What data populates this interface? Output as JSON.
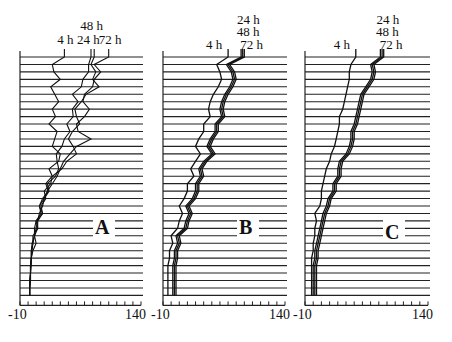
{
  "chart_data": {
    "type": "line",
    "title": "",
    "xlabel": "",
    "ylabel": "",
    "xlim": [
      -10,
      140
    ],
    "x_tick_labels": [
      "-10",
      "140"
    ],
    "x_tick_step": 10,
    "rows": 33,
    "grid": false,
    "panels": [
      {
        "label": "A",
        "series_labels": [
          "4 h",
          "24 h",
          "48 h",
          "72 h"
        ],
        "header_labels": [
          {
            "text": "48 h",
            "row": 0
          },
          {
            "text": "4 h",
            "row": 1
          },
          {
            "text": "24 h",
            "row": 1
          },
          {
            "text": "72 h",
            "row": 1
          }
        ],
        "series": [
          {
            "name": "4 h",
            "values": [
              45,
              30,
              32,
              40,
              28,
              33,
              38,
              30,
              34,
              26,
              36,
              33,
              30,
              40,
              38,
              26,
              30,
              22,
              25,
              18,
              14,
              18,
              12,
              12,
              8,
              10,
              6,
              4,
              4,
              3,
              3,
              2,
              2
            ]
          },
          {
            "name": "24 h",
            "values": [
              78,
              75,
              75,
              68,
              66,
              55,
              62,
              55,
              56,
              48,
              52,
              45,
              42,
              35,
              36,
              38,
              34,
              24,
              26,
              20,
              14,
              16,
              10,
              12,
              6,
              6,
              4,
              4,
              3,
              3,
              3,
              2,
              2
            ]
          },
          {
            "name": "48 h",
            "values": [
              82,
              78,
              84,
              80,
              88,
              72,
              66,
              58,
              60,
              64,
              55,
              50,
              56,
              60,
              48,
              42,
              30,
              28,
              20,
              22,
              16,
              18,
              10,
              8,
              8,
              5,
              4,
              4,
              3,
              3,
              2,
              2,
              2
            ]
          },
          {
            "name": "72 h",
            "values": [
              100,
              82,
              90,
              82,
              80,
              70,
              68,
              76,
              70,
              60,
              62,
              78,
              60,
              52,
              44,
              40,
              36,
              30,
              24,
              20,
              18,
              14,
              12,
              10,
              8,
              6,
              5,
              4,
              3,
              3,
              2,
              2,
              2
            ]
          }
        ]
      },
      {
        "label": "B",
        "series_labels": [
          "4 h",
          "24 h",
          "48 h",
          "72 h"
        ],
        "header_labels": [
          {
            "text": "24 h",
            "row": -2
          },
          {
            "text": "48 h",
            "row": -1
          },
          {
            "text": "4 h",
            "row": 0
          },
          {
            "text": "72 h",
            "row": 0
          }
        ],
        "series": [
          {
            "name": "4 h",
            "values": [
              70,
              56,
              60,
              62,
              58,
              52,
              48,
              46,
              48,
              40,
              40,
              34,
              30,
              36,
              30,
              24,
              28,
              20,
              20,
              16,
              10,
              14,
              10,
              8,
              0,
              2,
              -2,
              -2,
              -4,
              -4,
              -4,
              -4,
              -4
            ]
          },
          {
            "name": "24 h",
            "values": [
              86,
              68,
              74,
              76,
              72,
              66,
              62,
              60,
              62,
              54,
              54,
              48,
              44,
              50,
              40,
              34,
              36,
              30,
              30,
              26,
              18,
              22,
              18,
              16,
              6,
              8,
              4,
              4,
              2,
              2,
              2,
              2,
              2
            ]
          },
          {
            "name": "48 h",
            "values": [
              88,
              70,
              76,
              78,
              74,
              68,
              64,
              62,
              64,
              56,
              56,
              50,
              46,
              52,
              42,
              36,
              38,
              32,
              32,
              28,
              20,
              24,
              20,
              18,
              8,
              10,
              6,
              6,
              4,
              4,
              4,
              4,
              4
            ]
          },
          {
            "name": "72 h",
            "values": [
              90,
              72,
              78,
              80,
              76,
              70,
              66,
              64,
              66,
              58,
              58,
              52,
              48,
              54,
              44,
              38,
              40,
              34,
              34,
              30,
              22,
              26,
              22,
              20,
              10,
              12,
              8,
              8,
              6,
              6,
              6,
              6,
              6
            ]
          }
        ]
      },
      {
        "label": "C",
        "series_labels": [
          "4 h",
          "24 h",
          "48 h",
          "72 h"
        ],
        "header_labels": [
          {
            "text": "24 h",
            "row": -2
          },
          {
            "text": "48 h",
            "row": -1
          },
          {
            "text": "4 h",
            "row": 0
          },
          {
            "text": "72 h",
            "row": 0
          }
        ],
        "series": [
          {
            "name": "4 h",
            "values": [
              52,
              46,
              44,
              44,
              42,
              40,
              38,
              36,
              32,
              32,
              30,
              28,
              26,
              22,
              20,
              16,
              14,
              12,
              10,
              10,
              8,
              2,
              4,
              2,
              2,
              0,
              0,
              -2,
              -2,
              -2,
              -2,
              -2,
              -2
            ]
          },
          {
            "name": "24 h",
            "values": [
              82,
              70,
              72,
              70,
              64,
              58,
              56,
              54,
              52,
              50,
              46,
              46,
              44,
              40,
              32,
              30,
              30,
              24,
              24,
              18,
              16,
              12,
              10,
              8,
              6,
              4,
              2,
              2,
              0,
              0,
              0,
              0,
              0
            ]
          },
          {
            "name": "48 h",
            "values": [
              84,
              72,
              74,
              72,
              66,
              60,
              58,
              56,
              54,
              52,
              48,
              48,
              46,
              42,
              34,
              32,
              32,
              26,
              26,
              20,
              18,
              14,
              12,
              10,
              8,
              6,
              4,
              4,
              2,
              2,
              2,
              2,
              2
            ]
          },
          {
            "name": "72 h",
            "values": [
              86,
              74,
              76,
              74,
              68,
              62,
              60,
              58,
              56,
              54,
              50,
              50,
              48,
              44,
              36,
              34,
              34,
              28,
              28,
              22,
              20,
              16,
              14,
              12,
              10,
              8,
              6,
              6,
              4,
              4,
              4,
              4,
              4
            ]
          }
        ]
      }
    ]
  }
}
